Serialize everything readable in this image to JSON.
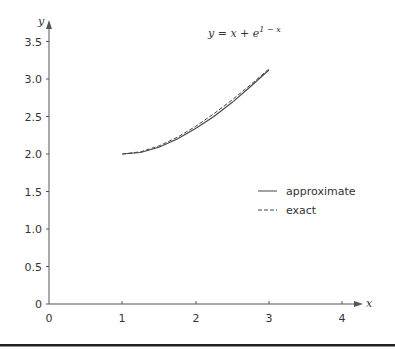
{
  "chart_data": {
    "type": "line",
    "xlabel": "x",
    "ylabel": "y",
    "xlim": [
      0,
      4.3
    ],
    "ylim": [
      0,
      3.7
    ],
    "x_ticks": [
      0,
      1,
      2,
      3,
      4
    ],
    "x_tick_labels": [
      "0",
      "1",
      "2",
      "3",
      "4"
    ],
    "y_ticks": [
      0,
      0.5,
      1.0,
      1.5,
      2.0,
      2.5,
      3.0,
      3.5
    ],
    "y_tick_labels": [
      "0",
      "0.5",
      "1.0",
      "1.5",
      "2.0",
      "2.5",
      "3.0",
      "3.5"
    ],
    "grid": false,
    "legend_position": "right-middle",
    "x": [
      1.0,
      1.25,
      1.5,
      1.75,
      2.0,
      2.25,
      2.5,
      2.75,
      3.0
    ],
    "series": [
      {
        "name": "approximate",
        "style": "solid",
        "values": [
          2.0,
          2.02,
          2.09,
          2.2,
          2.34,
          2.5,
          2.69,
          2.9,
          3.12
        ]
      },
      {
        "name": "exact",
        "style": "dashed",
        "values": [
          2.0,
          2.029,
          2.107,
          2.222,
          2.368,
          2.537,
          2.723,
          2.922,
          3.135
        ]
      }
    ]
  },
  "labels": {
    "equation": "y = x + e",
    "equation_exp": "1 − x",
    "x_axis": "x",
    "y_axis": "y",
    "legend": [
      "approximate",
      "exact"
    ],
    "x_ticks": [
      "0",
      "1",
      "2",
      "3",
      "4"
    ],
    "y_ticks": [
      "0",
      "0.5",
      "1.0",
      "1.5",
      "2.0",
      "2.5",
      "3.0",
      "3.5"
    ]
  },
  "colors": {
    "axis": "#555555",
    "line": "#444444",
    "rule": "#222222"
  }
}
